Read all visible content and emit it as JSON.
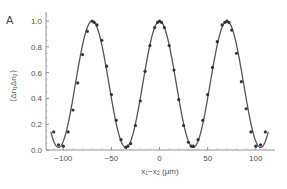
{
  "chart_data": {
    "type": "line",
    "panel_label": "A",
    "title": "",
    "xlabel": "x₁−x₂ (μm)",
    "ylabel": "⟨Δn₁Δn₂⟩",
    "xlim": [
      -118,
      120
    ],
    "ylim": [
      0,
      1.07
    ],
    "xticks": [
      -100,
      -50,
      0,
      50,
      100
    ],
    "xtick_labels": [
      "−100",
      "−50",
      "0",
      "50",
      "100"
    ],
    "yticks": [
      0.0,
      0.2,
      0.4,
      0.6,
      0.8,
      1.0
    ],
    "ytick_labels": [
      "0.0",
      "0.2",
      "0.4",
      "0.6",
      "0.8",
      "1.0"
    ],
    "grid": false,
    "legend": "none",
    "series": [
      {
        "name": "fit",
        "style": "line",
        "color": "#555555",
        "model": "cos^2(pi*x/period)*(1-offset)+offset",
        "period": 70,
        "offset": 0.02,
        "x_range": [
          -113,
          113
        ]
      },
      {
        "name": "data",
        "style": "markers",
        "color": "#333333",
        "x": [
          -110,
          -105,
          -100,
          -95,
          -90,
          -85,
          -80,
          -75,
          -70,
          -68,
          -65,
          -60,
          -55,
          -50,
          -45,
          -40,
          -35,
          -33,
          -30,
          -25,
          -20,
          -15,
          -10,
          -5,
          -2,
          0,
          2,
          5,
          10,
          15,
          20,
          25,
          30,
          33,
          35,
          40,
          45,
          50,
          55,
          60,
          65,
          68,
          70,
          72,
          75,
          80,
          85,
          90,
          95,
          100,
          105,
          110
        ],
        "y": [
          0.14,
          0.04,
          0.03,
          0.14,
          0.31,
          0.52,
          0.74,
          0.92,
          1.0,
          0.99,
          0.97,
          0.85,
          0.65,
          0.43,
          0.23,
          0.08,
          0.02,
          0.03,
          0.05,
          0.19,
          0.38,
          0.61,
          0.81,
          0.95,
          0.99,
          1.0,
          0.99,
          0.95,
          0.81,
          0.62,
          0.39,
          0.19,
          0.06,
          0.03,
          0.03,
          0.08,
          0.23,
          0.43,
          0.64,
          0.84,
          0.97,
          0.99,
          1.0,
          0.99,
          0.93,
          0.75,
          0.53,
          0.32,
          0.14,
          0.03,
          0.04,
          0.14
        ]
      }
    ]
  }
}
